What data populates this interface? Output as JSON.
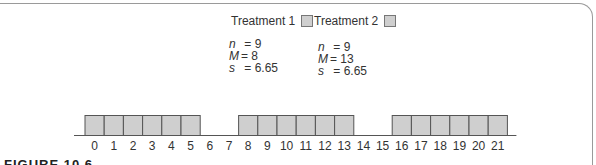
{
  "figure": {
    "caption": "FIGURE 10.6"
  },
  "legend": {
    "treatment1_label": "Treatment 1",
    "treatment2_label": "Treatment 2"
  },
  "stats": {
    "treatment1": {
      "n_label": "n",
      "n_value": "= 9",
      "M_label": "M",
      "M_value": "= 8",
      "s_label": "s",
      "s_value": "= 6.65"
    },
    "treatment2": {
      "n_label": "n",
      "n_value": "= 9",
      "M_label": "M",
      "M_value": "= 13",
      "s_label": "s",
      "s_value": "= 6.65"
    }
  },
  "colors": {
    "box_fill": "#cfcfcf",
    "box_stroke": "#555555",
    "axis": "#555555"
  },
  "chart_data": {
    "type": "bar",
    "title": "",
    "xlabel": "",
    "ylabel": "",
    "x_ticks": [
      0,
      1,
      2,
      3,
      4,
      5,
      6,
      7,
      8,
      9,
      10,
      11,
      12,
      13,
      14,
      15,
      16,
      17,
      18,
      19,
      20,
      21
    ],
    "categories": [
      "0",
      "1",
      "2",
      "3",
      "4",
      "5",
      "6",
      "7",
      "8",
      "9",
      "10",
      "11",
      "12",
      "13",
      "14",
      "15",
      "16",
      "17",
      "18",
      "19",
      "20",
      "21"
    ],
    "values": [
      1,
      1,
      1,
      1,
      1,
      1,
      0,
      0,
      1,
      1,
      1,
      1,
      1,
      1,
      0,
      0,
      1,
      1,
      1,
      1,
      1,
      1
    ],
    "series": [
      {
        "name": "Treatment 1",
        "n": 9,
        "M": 8,
        "s": 6.65
      },
      {
        "name": "Treatment 2",
        "n": 9,
        "M": 13,
        "s": 6.65
      }
    ],
    "grid": false,
    "legend_position": "top",
    "xlim": [
      0,
      21
    ]
  }
}
